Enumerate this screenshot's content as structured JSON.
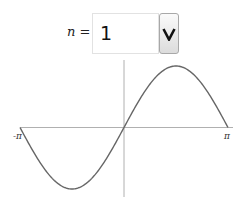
{
  "control": {
    "label": "n =",
    "value": "1",
    "button_icon": "chevron-down-icon"
  },
  "colors": {
    "curve": "#666666",
    "axis": "#b0b0b0"
  },
  "chart_data": {
    "type": "line",
    "title": "",
    "function": "sin(n x)",
    "n": 1,
    "xlabel": "",
    "ylabel": "",
    "xlim": [
      -3.14159,
      3.14159
    ],
    "ylim": [
      -1,
      1
    ],
    "x_tick_labels": [
      "-π",
      "π"
    ],
    "grid": false,
    "legend": null,
    "series": [
      {
        "name": "sin(x)",
        "x": [
          -3.14159,
          -2.356,
          -1.5708,
          -0.785,
          0,
          0.785,
          1.5708,
          2.356,
          3.14159
        ],
        "values": [
          0,
          -0.707,
          -1,
          -0.707,
          0,
          0.707,
          1,
          0.707,
          0
        ]
      }
    ]
  }
}
